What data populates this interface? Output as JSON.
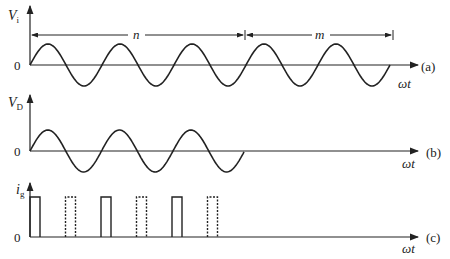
{
  "figure": {
    "panels": [
      {
        "id": "a",
        "tag": "(a)",
        "y_label": "V",
        "y_label_sub": "i",
        "zero_label": "0",
        "x_label": "ωt",
        "signal": "sinusoid",
        "cycles_shown": 5,
        "intervals": [
          {
            "label": "n",
            "cycles": 3
          },
          {
            "label": "m",
            "cycles": 2
          }
        ]
      },
      {
        "id": "b",
        "tag": "(b)",
        "y_label": "V",
        "y_label_sub": "D",
        "zero_label": "0",
        "x_label": "ωt",
        "signal": "sinusoid",
        "cycles_shown": 3
      },
      {
        "id": "c",
        "tag": "(c)",
        "y_label": "i",
        "y_label_sub": "g",
        "zero_label": "0",
        "x_label": "ωt",
        "signal": "pulse train",
        "pulses": [
          {
            "style": "solid"
          },
          {
            "style": "dashed"
          },
          {
            "style": "solid"
          },
          {
            "style": "dashed"
          },
          {
            "style": "solid"
          },
          {
            "style": "dashed"
          }
        ]
      }
    ]
  },
  "colors": {
    "ink": "#222222",
    "background": "#ffffff"
  }
}
